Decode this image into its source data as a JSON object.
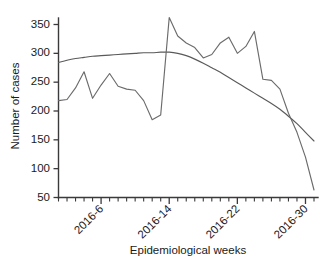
{
  "chart_data": {
    "type": "line",
    "title": "",
    "xlabel": "Epidemiological weeks",
    "ylabel": "Number of cases",
    "grid": false,
    "legend": "none",
    "ylim": [
      50,
      370
    ],
    "yticks": [
      50,
      100,
      150,
      200,
      250,
      300,
      350
    ],
    "ytick_labels": [
      "50",
      "100",
      "150",
      "200",
      "250",
      "300",
      "350"
    ],
    "xlim": [
      1,
      31
    ],
    "xticks_major": [
      6,
      14,
      22,
      30
    ],
    "xtick_labels": [
      "2016-6",
      "2016-14",
      "2016-22",
      "2016-30"
    ],
    "xticks_minor_step": 1,
    "x": [
      1,
      2,
      3,
      4,
      5,
      6,
      7,
      8,
      9,
      10,
      11,
      12,
      13,
      14,
      15,
      16,
      17,
      18,
      19,
      20,
      21,
      22,
      23,
      24,
      25,
      26,
      27,
      28,
      29,
      30,
      31
    ],
    "series": [
      {
        "name": "observed",
        "color": "#6b6b6b",
        "style": "jagged",
        "values": [
          218,
          220,
          240,
          268,
          222,
          245,
          265,
          243,
          238,
          236,
          218,
          185,
          193,
          362,
          330,
          318,
          310,
          292,
          298,
          318,
          328,
          300,
          312,
          338,
          255,
          253,
          238,
          196,
          163,
          120,
          63
        ]
      },
      {
        "name": "trend",
        "color": "#5a5a5a",
        "style": "smooth",
        "values": [
          284,
          288,
          291,
          293,
          295,
          296,
          297,
          298,
          299,
          300,
          301,
          301,
          302,
          302,
          300,
          296,
          290,
          283,
          275,
          267,
          258,
          249,
          240,
          231,
          222,
          213,
          203,
          191,
          178,
          163,
          148
        ]
      }
    ]
  },
  "axes": {
    "y_title": "Number of cases",
    "x_title": "Epidemiological weeks"
  }
}
